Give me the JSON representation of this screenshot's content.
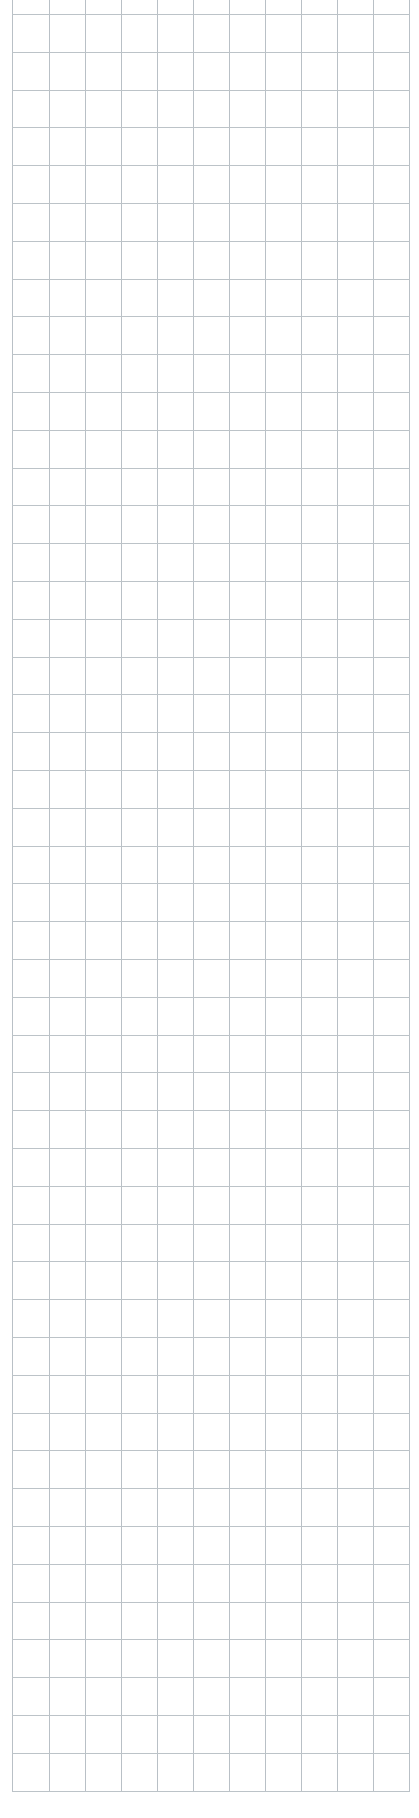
{
  "page": {
    "background_color": "#ffffff",
    "line_color": "#b9c0c6"
  },
  "grid": {
    "vertical_lines_x": [
      12,
      49,
      85,
      121,
      157,
      193,
      229,
      265,
      301,
      337,
      373,
      409
    ],
    "vertical_top": 0,
    "vertical_bottom": 1790,
    "horizontal_first_y": 14,
    "horizontal_spacing": 37.8,
    "horizontal_count": 48,
    "horizontal_left": 12,
    "horizontal_right": 409
  }
}
